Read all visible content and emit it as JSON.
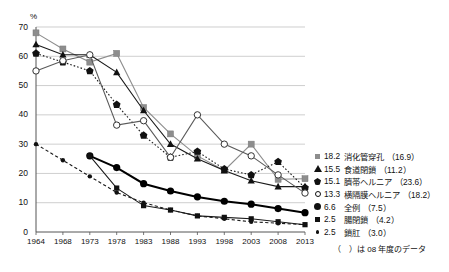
{
  "axes": {
    "y_unit": "%",
    "y_ticks": [
      0,
      10,
      20,
      30,
      40,
      50,
      60,
      70
    ],
    "x_ticks": [
      "1964",
      "1968",
      "1973",
      "1978",
      "1983",
      "1988",
      "1993",
      "1998",
      "2003",
      "2008",
      "2013"
    ]
  },
  "footnote": "（　）は 08 年度のデータ",
  "legend": [
    {
      "marker": "gray-square",
      "value": "18.2",
      "name": "消化管穿孔",
      "paren": "（16.9）"
    },
    {
      "marker": "black-triangle",
      "value": "15.5",
      "name": "食道閉鎖",
      "paren": "（11.2）"
    },
    {
      "marker": "black-diamond",
      "value": "15.1",
      "name": "臍帯ヘルニア",
      "paren": "（23.6）"
    },
    {
      "marker": "open-circle",
      "value": "13.3",
      "name": "横隔膜ヘルニア",
      "paren": "（18.2）"
    },
    {
      "marker": "filled-circle",
      "value": "6.6",
      "name": "全例",
      "paren": "（7.5）"
    },
    {
      "marker": "small-square",
      "value": "2.5",
      "name": "腸閉鎖",
      "paren": "（4.2）"
    },
    {
      "marker": "small-dot",
      "value": "2.5",
      "name": "鎖肛",
      "paren": "（3.0）"
    }
  ],
  "chart_data": {
    "type": "line",
    "title": "",
    "xlabel": "",
    "ylabel": "%",
    "ylim": [
      0,
      70
    ],
    "grid": true,
    "legend_position": "right",
    "x": [
      "1964",
      "1968",
      "1973",
      "1978",
      "1983",
      "1988",
      "1993",
      "1998",
      "2003",
      "2008",
      "2013"
    ],
    "series": [
      {
        "name": "消化管穿孔",
        "marker": "gray-square",
        "color": "#8d8d8d",
        "style": "solid",
        "values": [
          68.0,
          62.5,
          58.0,
          61.0,
          42.5,
          33.5,
          26.0,
          21.0,
          30.0,
          18.0,
          18.2
        ]
      },
      {
        "name": "食道閉鎖",
        "marker": "black-triangle",
        "color": "#1a1a1a",
        "style": "solid",
        "values": [
          64.0,
          60.5,
          60.5,
          54.5,
          41.5,
          30.0,
          25.0,
          21.0,
          17.5,
          15.5,
          15.5
        ]
      },
      {
        "name": "臍帯ヘルニア",
        "marker": "black-diamond",
        "color": "#1a1a1a",
        "style": "dotted",
        "values": [
          61.0,
          58.0,
          55.0,
          43.5,
          33.0,
          25.5,
          27.5,
          21.5,
          19.5,
          24.0,
          15.1
        ]
      },
      {
        "name": "横隔膜ヘルニア",
        "marker": "open-circle",
        "color": "#5a5a5a",
        "style": "solid",
        "values": [
          55.0,
          58.5,
          60.5,
          36.5,
          38.0,
          25.5,
          40.0,
          30.0,
          26.0,
          19.5,
          13.3
        ]
      },
      {
        "name": "全例",
        "marker": "filled-circle",
        "color": "#000000",
        "style": "solid",
        "values": [
          null,
          null,
          26.0,
          22.0,
          16.5,
          14.0,
          12.0,
          10.5,
          9.5,
          8.0,
          6.6
        ]
      },
      {
        "name": "腸閉鎖",
        "marker": "small-square",
        "color": "#1a1a1a",
        "style": "solid",
        "values": [
          null,
          null,
          26.0,
          15.0,
          9.0,
          7.5,
          5.5,
          5.0,
          4.5,
          3.5,
          2.5
        ]
      },
      {
        "name": "鎖肛",
        "marker": "small-dot",
        "color": "#1a1a1a",
        "style": "dashed",
        "values": [
          30.0,
          24.5,
          19.0,
          13.5,
          10.0,
          7.5,
          5.5,
          4.5,
          3.5,
          3.0,
          2.5
        ]
      }
    ]
  }
}
